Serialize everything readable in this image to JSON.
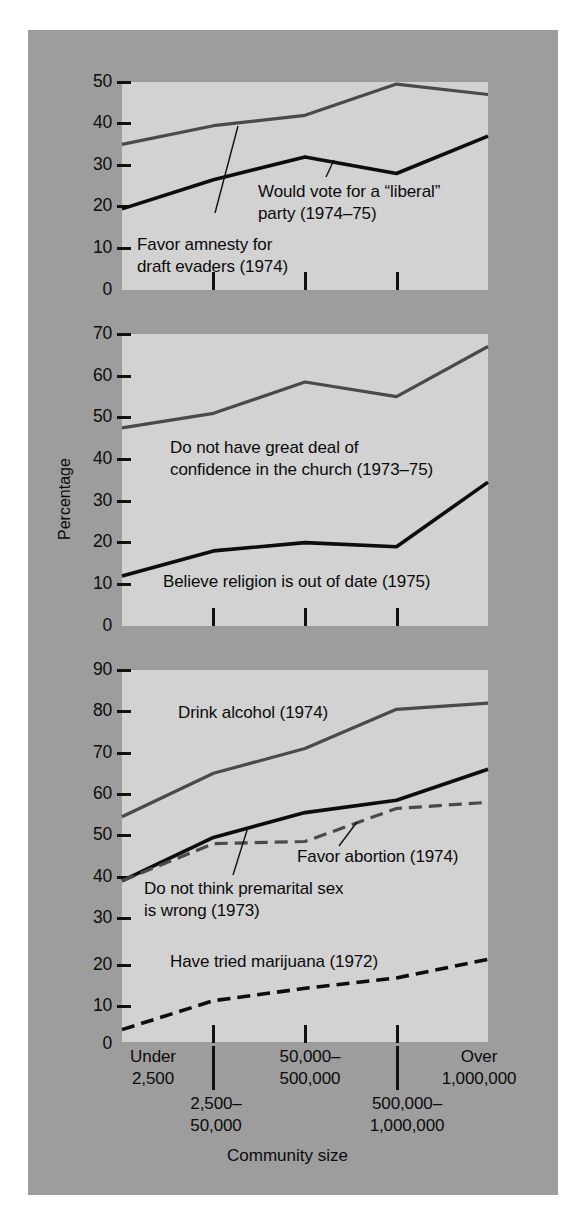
{
  "figure": {
    "ylabel": "Percentage",
    "xlabel": "Community size",
    "background_color": "#9d9d9d",
    "plot_color": "#d2d2d2",
    "dark_series_color": "#0d0d0d",
    "gray_series_color": "#4a4a4a"
  },
  "xaxis": {
    "categories": [
      "Under\n2,500",
      "2,500–\n50,000",
      "50,000–\n500,000",
      "500,000–\n1,000,000",
      "Over\n1,000,000"
    ],
    "tick_labels_top": [
      "Under\n2,500",
      "50,000–\n500,000",
      "Over\n1,000,000"
    ],
    "tick_labels_bottom": [
      "2,500–\n50,000",
      "500,000–\n1,000,000"
    ]
  },
  "panels": [
    {
      "id": "panel-politics",
      "yticks": [
        0,
        10,
        20,
        30,
        40,
        50
      ],
      "ylim": [
        0,
        50
      ],
      "annotations": [
        {
          "id": "ann-liberal",
          "text": "Would vote for a “liberal”\nparty (1974–75)"
        },
        {
          "id": "ann-amnesty",
          "text": "Favor amnesty for\ndraft evaders (1974)"
        }
      ]
    },
    {
      "id": "panel-religion",
      "yticks": [
        0,
        10,
        20,
        30,
        40,
        50,
        60,
        70
      ],
      "ylim": [
        0,
        70
      ],
      "annotations": [
        {
          "id": "ann-confidence",
          "text": "Do not have great deal of\nconfidence in the church (1973–75)"
        },
        {
          "id": "ann-religion",
          "text": "Believe religion is out of date (1975)"
        }
      ]
    },
    {
      "id": "panel-morals",
      "yticks": [
        0,
        10,
        20,
        30,
        40,
        50,
        60,
        70,
        80,
        90
      ],
      "ylim": [
        0,
        90
      ],
      "annotations": [
        {
          "id": "ann-alcohol",
          "text": "Drink alcohol (1974)"
        },
        {
          "id": "ann-abortion",
          "text": "Favor abortion (1974)"
        },
        {
          "id": "ann-premarital",
          "text": "Do not think premarital sex\nis wrong (1973)"
        },
        {
          "id": "ann-marijuana",
          "text": "Have tried marijuana (1972)"
        }
      ]
    }
  ],
  "chart_data": [
    {
      "type": "line",
      "panel": "panel-politics",
      "title": "",
      "xlabel": "Community size",
      "ylabel": "Percentage",
      "ylim": [
        0,
        50
      ],
      "yticks": [
        0,
        10,
        20,
        30,
        40,
        50
      ],
      "grid": false,
      "legend": "inline-annotations",
      "categories": [
        "Under 2,500",
        "2,500–50,000",
        "50,000–500,000",
        "500,000–1,000,000",
        "Over 1,000,000"
      ],
      "series": [
        {
          "name": "Would vote for a “liberal” party (1974–75)",
          "style": "solid",
          "color": "#4a4a4a",
          "values": [
            35,
            39.5,
            42,
            49.5,
            47
          ]
        },
        {
          "name": "Favor amnesty for draft evaders (1974)",
          "style": "solid",
          "color": "#0d0d0d",
          "values": [
            19.5,
            26.5,
            32,
            28,
            37
          ]
        }
      ]
    },
    {
      "type": "line",
      "panel": "panel-religion",
      "title": "",
      "xlabel": "Community size",
      "ylabel": "Percentage",
      "ylim": [
        0,
        70
      ],
      "yticks": [
        0,
        10,
        20,
        30,
        40,
        50,
        60,
        70
      ],
      "grid": false,
      "legend": "inline-annotations",
      "categories": [
        "Under 2,500",
        "2,500–50,000",
        "50,000–500,000",
        "500,000–1,000,000",
        "Over 1,000,000"
      ],
      "series": [
        {
          "name": "Do not have great deal of confidence in the church (1973–75)",
          "style": "solid",
          "color": "#4a4a4a",
          "values": [
            47.5,
            51,
            58.5,
            55,
            67
          ]
        },
        {
          "name": "Believe religion is out of date (1975)",
          "style": "solid",
          "color": "#0d0d0d",
          "values": [
            12,
            18,
            20,
            19,
            34.5
          ]
        }
      ]
    },
    {
      "type": "line",
      "panel": "panel-morals",
      "title": "",
      "xlabel": "Community size",
      "ylabel": "Percentage",
      "ylim": [
        0,
        90
      ],
      "yticks": [
        0,
        10,
        20,
        30,
        40,
        50,
        60,
        70,
        80,
        90
      ],
      "grid": false,
      "legend": "inline-annotations",
      "categories": [
        "Under 2,500",
        "2,500–50,000",
        "50,000–500,000",
        "500,000–1,000,000",
        "Over 1,000,000"
      ],
      "series": [
        {
          "name": "Drink alcohol (1974)",
          "style": "solid",
          "color": "#4a4a4a",
          "values": [
            54.5,
            65,
            71,
            80.5,
            82
          ]
        },
        {
          "name": "Do not think premarital sex is wrong (1973)",
          "style": "solid",
          "color": "#0d0d0d",
          "values": [
            39,
            49.5,
            55.5,
            58.5,
            66
          ]
        },
        {
          "name": "Favor abortion (1974)",
          "style": "dashed",
          "color": "#4a4a4a",
          "values": [
            39,
            48,
            48.5,
            56.5,
            58
          ]
        },
        {
          "name": "Have tried marijuana (1972)",
          "style": "dashed",
          "color": "#0d0d0d",
          "values": [
            3,
            10,
            13,
            15.5,
            20
          ]
        }
      ]
    }
  ]
}
